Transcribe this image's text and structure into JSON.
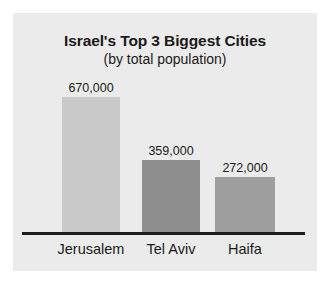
{
  "chart_data": {
    "type": "bar",
    "title": "Israel's Top 3 Biggest Cities",
    "subtitle": "(by total population)",
    "xlabel": "",
    "ylabel": "",
    "grid": false,
    "legend": "none",
    "ylim": [
      0,
      670000
    ],
    "categories": [
      "Jerusalem",
      "Tel Aviv",
      "Haifa"
    ],
    "values": [
      670000,
      359000,
      272000
    ],
    "value_labels": [
      "670,000",
      "359,000",
      "272,000"
    ],
    "bar_colors": [
      "#c9c9c9",
      "#8e8e8e",
      "#9e9e9e"
    ]
  },
  "style": {
    "panel_background": "#ebebeb",
    "page_background": "#ffffff",
    "axis_color": "#1c1c1c",
    "text_color": "#1a1a1a"
  }
}
